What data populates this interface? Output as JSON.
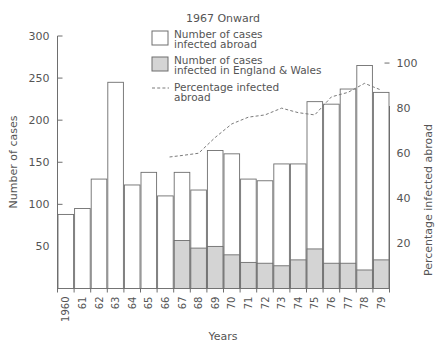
{
  "chart_data": {
    "type": "bar",
    "title": "1967 Onward",
    "xlabel": "Years",
    "ylabel": "Number of cases",
    "y2label": "Percentage infected abroad",
    "ylim": [
      0,
      300
    ],
    "y2lim": [
      0,
      112
    ],
    "yticks": [
      50,
      100,
      150,
      200,
      250,
      300
    ],
    "y2ticks": [
      20,
      40,
      60,
      80,
      100
    ],
    "grid": false,
    "legend_position": "top-center",
    "categories": [
      "1960",
      "61",
      "62",
      "63",
      "64",
      "65",
      "66",
      "67",
      "68",
      "69",
      "70",
      "71",
      "72",
      "73",
      "74",
      "75",
      "76",
      "77",
      "78",
      "79"
    ],
    "series": [
      {
        "name": "Number of cases infected abroad",
        "type": "bar",
        "style": "open",
        "values": [
          88,
          95,
          130,
          245,
          123,
          138,
          110,
          81,
          69,
          114,
          120,
          99,
          98,
          121,
          114,
          175,
          189,
          208,
          243,
          199
        ]
      },
      {
        "name": "Number of cases infected in England & Wales",
        "type": "bar",
        "style": "shaded",
        "values": [
          0,
          0,
          0,
          0,
          0,
          0,
          0,
          57,
          48,
          50,
          40,
          31,
          30,
          27,
          34,
          47,
          30,
          30,
          22,
          34
        ]
      },
      {
        "name": "Total number of cases",
        "type": "bar-total",
        "values": [
          88,
          95,
          130,
          245,
          123,
          138,
          110,
          138,
          117,
          164,
          160,
          130,
          128,
          148,
          148,
          222,
          219,
          237,
          265,
          233
        ]
      },
      {
        "name": "Percentage infected abroad",
        "type": "line",
        "style": "dashed",
        "axis": "right",
        "x": [
          "67",
          "68",
          "69",
          "70",
          "71",
          "72",
          "73",
          "74",
          "75",
          "76",
          "77",
          "78",
          "79"
        ],
        "values": [
          59,
          60,
          67,
          73,
          76,
          77,
          80,
          78,
          77,
          85,
          87,
          91,
          88
        ]
      }
    ],
    "legend": [
      {
        "marker": "open-square",
        "label_line1": "Number of cases",
        "label_line2": "infected abroad"
      },
      {
        "marker": "shaded-square",
        "label_line1": "Number of  cases",
        "label_line2": "infected in England & Wales"
      },
      {
        "marker": "dashed-line",
        "label_line1": "Percentage infected",
        "label_line2": "abroad"
      }
    ],
    "colors": {
      "axis": "#6e6e6e",
      "bar_open_fill": "#ffffff",
      "bar_shaded_fill": "#d4d4d4",
      "line": "#7a7a7a",
      "text": "#555555",
      "background": "#ffffff"
    }
  }
}
